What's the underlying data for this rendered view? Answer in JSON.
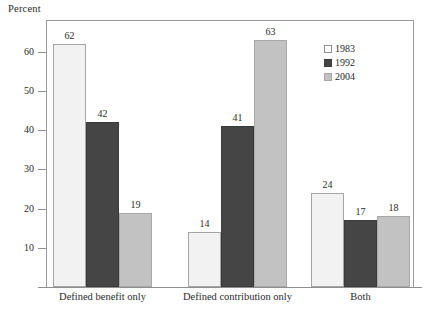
{
  "chart_data": {
    "type": "bar",
    "title": "Percent",
    "xlabel": "",
    "ylabel": "Percent",
    "ylim": [
      0,
      65
    ],
    "yticks": [
      10,
      20,
      30,
      40,
      50,
      60
    ],
    "grid": false,
    "legend_position": "top-right",
    "categories": [
      "Defined benefit only",
      "Defined contribution only",
      "Both"
    ],
    "series": [
      {
        "name": "1983",
        "color": "#f2f2f2",
        "values": [
          62,
          14,
          24
        ]
      },
      {
        "name": "1992",
        "color": "#454545",
        "values": [
          42,
          41,
          17
        ]
      },
      {
        "name": "2004",
        "color": "#c2c2c2",
        "values": [
          19,
          63,
          18
        ]
      }
    ],
    "data_labels": [
      [
        "62",
        "42",
        "19"
      ],
      [
        "14",
        "41",
        "63"
      ],
      [
        "24",
        "17",
        "18"
      ]
    ]
  },
  "axis": {
    "title": "Percent",
    "tick_labels": [
      "60",
      "50",
      "40",
      "30",
      "20",
      "10"
    ]
  },
  "legend": {
    "items": [
      {
        "label": "1983"
      },
      {
        "label": "1992"
      },
      {
        "label": "2004"
      }
    ]
  }
}
